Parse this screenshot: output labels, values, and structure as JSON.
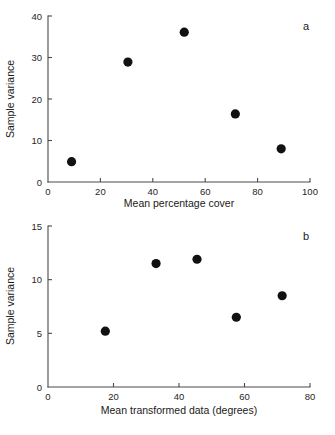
{
  "figure": {
    "panel_a_label": "a",
    "panel_b_label": "b"
  },
  "chart_data": [
    {
      "type": "scatter",
      "panel": "a",
      "title": "",
      "xlabel": "Mean percentage cover",
      "ylabel": "Sample variance",
      "xlim": [
        0,
        100
      ],
      "ylim": [
        0,
        40
      ],
      "xticks": [
        0,
        20,
        40,
        60,
        80,
        100
      ],
      "yticks": [
        0,
        10,
        20,
        30,
        40
      ],
      "xticklabels": [
        "0",
        "20",
        "40",
        "60",
        "80",
        "100"
      ],
      "yticklabels": [
        "0",
        "10",
        "20",
        "30",
        "40"
      ],
      "grid": false,
      "legend": false,
      "marker": "filled-circle",
      "marker_color": "#111111",
      "x": [
        9,
        30.5,
        52,
        71.5,
        89
      ],
      "y": [
        4.9,
        28.9,
        36.1,
        16.4,
        8.0
      ]
    },
    {
      "type": "scatter",
      "panel": "b",
      "title": "",
      "xlabel": "Mean transformed data (degrees)",
      "ylabel": "Sample variance",
      "xlim": [
        0,
        80
      ],
      "ylim": [
        0,
        15
      ],
      "xticks": [
        0,
        20,
        40,
        60,
        80
      ],
      "yticks": [
        0,
        5,
        10,
        15
      ],
      "xticklabels": [
        "0",
        "20",
        "40",
        "60",
        "80"
      ],
      "yticklabels": [
        "0",
        "5",
        "10",
        "15"
      ],
      "grid": false,
      "legend": false,
      "marker": "filled-circle",
      "marker_color": "#111111",
      "x": [
        17.5,
        33,
        45.5,
        57.5,
        71.5
      ],
      "y": [
        5.2,
        11.5,
        11.9,
        6.5,
        8.5
      ]
    }
  ]
}
